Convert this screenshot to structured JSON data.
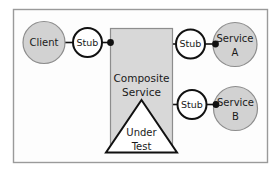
{
  "figure": {
    "kind": "architecture-diagram",
    "frame": {
      "border_color": "#9a9a9a",
      "background": "#fdfdfd"
    },
    "palette": {
      "circle_fill": "#d2d2d2",
      "circle_stroke": "#8d8d8d",
      "stub_fill": "#ffffff",
      "stub_stroke": "#111111",
      "box_fill": "#d8d8d8",
      "box_stroke": "#8d8d8d",
      "triangle_fill": "#ffffff",
      "triangle_stroke": "#111111",
      "connector_color": "#111111",
      "text_color": "#1a1a1a"
    },
    "nodes": {
      "client": {
        "label": "Client",
        "shape": "circle"
      },
      "stub_client": {
        "label": "Stub",
        "shape": "circle"
      },
      "stub_a": {
        "label": "Stub",
        "shape": "circle"
      },
      "stub_b": {
        "label": "Stub",
        "shape": "circle"
      },
      "service_a": {
        "label_line1": "Service",
        "label_line2": "A",
        "shape": "circle"
      },
      "service_b": {
        "label_line1": "Service",
        "label_line2": "B",
        "shape": "circle"
      },
      "composite": {
        "label_line1": "Composite",
        "label_line2": "Service",
        "shape": "rectangle"
      },
      "under_test": {
        "label_line1": "Under",
        "label_line2": "Test",
        "shape": "triangle"
      }
    },
    "connectors": [
      {
        "from": "client",
        "to": "stub_client",
        "style": "line"
      },
      {
        "from": "stub_client",
        "to": "composite",
        "style": "line-with-dot"
      },
      {
        "from": "composite",
        "to": "stub_a",
        "style": "line"
      },
      {
        "from": "stub_a",
        "to": "service_a",
        "style": "line-with-dot"
      },
      {
        "from": "composite",
        "to": "stub_b",
        "style": "line"
      },
      {
        "from": "stub_b",
        "to": "service_b",
        "style": "line-with-dot"
      }
    ]
  }
}
